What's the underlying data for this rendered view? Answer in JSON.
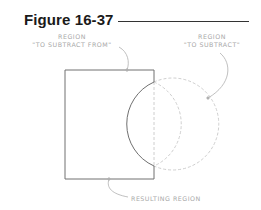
{
  "figure": {
    "title": "Figure 16-37",
    "labels": {
      "from_line1": "REGION",
      "from_line2": "\"TO SUBTRACT FROM\"",
      "sub_line1": "REGION",
      "sub_line2": "\"TO SUBTRACT\"",
      "result": "RESULTING REGION"
    },
    "colors": {
      "title": "#1a1a1a",
      "result_outline": "#707070",
      "removed_outline": "#c8c8c8",
      "leader": "#b0b0b0",
      "label": "#a8a8a8"
    }
  }
}
